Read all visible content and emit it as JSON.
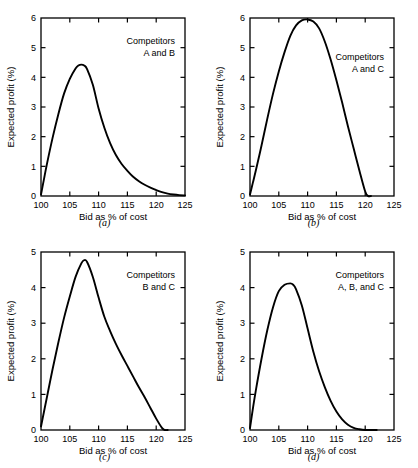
{
  "figure": {
    "background": "#ffffff",
    "line_color": "#000000",
    "axis_color": "#000000"
  },
  "panels": [
    {
      "key": "a",
      "caption": "(a)",
      "legend": {
        "line1": "Competitors",
        "line2": "A and B"
      },
      "chart_data": {
        "type": "line",
        "title": "Competitors A and B",
        "xlabel": "Bid as % of cost",
        "ylabel": "Expected profit (%)",
        "xlim": [
          100,
          125
        ],
        "ylim": [
          0,
          6
        ],
        "xticks": [
          100,
          105,
          110,
          115,
          120,
          125
        ],
        "yticks": [
          0,
          1,
          2,
          3,
          4,
          5,
          6
        ],
        "grid": false,
        "legend_position": "top-right",
        "series": [
          {
            "name": "A and B",
            "x": [
              100,
              100.5,
              101,
              102,
              103,
              104,
              105,
              106,
              106.5,
              107,
              107.5,
              108,
              109,
              110,
              111,
              112,
              113,
              114,
              115,
              116,
              117,
              118,
              119,
              120,
              121,
              122,
              123,
              124,
              125
            ],
            "values": [
              0.05,
              0.55,
              1.05,
              1.95,
              2.75,
              3.45,
              3.95,
              4.3,
              4.4,
              4.43,
              4.4,
              4.28,
              3.75,
              2.95,
              2.3,
              1.78,
              1.38,
              1.08,
              0.85,
              0.65,
              0.5,
              0.38,
              0.28,
              0.2,
              0.13,
              0.08,
              0.05,
              0.03,
              0.02
            ]
          }
        ]
      }
    },
    {
      "key": "b",
      "caption": "(b)",
      "legend": {
        "line1": "Competitors",
        "line2": "A and C"
      },
      "chart_data": {
        "type": "line",
        "title": "Competitors A and C",
        "xlabel": "Bid as % of cost",
        "ylabel": "Expected profit (%)",
        "xlim": [
          100,
          125
        ],
        "ylim": [
          0,
          6
        ],
        "xticks": [
          100,
          105,
          110,
          115,
          120,
          125
        ],
        "yticks": [
          0,
          1,
          2,
          3,
          4,
          5,
          6
        ],
        "grid": false,
        "legend_position": "right",
        "series": [
          {
            "name": "A and C",
            "x": [
              100,
              100.5,
              101,
              102,
              103,
              104,
              105,
              106,
              107,
              108,
              109,
              110,
              111,
              112,
              113,
              114,
              115,
              116,
              117,
              118,
              119,
              120,
              120.5,
              121
            ],
            "values": [
              0.05,
              0.45,
              0.85,
              1.7,
              2.6,
              3.45,
              4.2,
              4.85,
              5.4,
              5.75,
              5.92,
              5.95,
              5.88,
              5.65,
              5.2,
              4.6,
              3.9,
              3.15,
              2.35,
              1.6,
              0.85,
              0.15,
              0.0,
              0.0
            ]
          }
        ]
      }
    },
    {
      "key": "c",
      "caption": "(c)",
      "legend": {
        "line1": "Competitors",
        "line2": "B and C"
      },
      "chart_data": {
        "type": "line",
        "title": "Competitors B and C",
        "xlabel": "Bid as % of cost",
        "ylabel": "Expected profit (%)",
        "xlim": [
          100,
          125
        ],
        "ylim": [
          0,
          5
        ],
        "xticks": [
          100,
          105,
          110,
          115,
          120,
          125
        ],
        "yticks": [
          0,
          1,
          2,
          3,
          4,
          5
        ],
        "grid": false,
        "legend_position": "top-right",
        "series": [
          {
            "name": "B and C",
            "x": [
              100,
              100.5,
              101,
              102,
              103,
              104,
              105,
              106,
              107,
              107.5,
              108,
              109,
              110,
              111,
              112,
              113,
              114,
              115,
              116,
              117,
              118,
              119,
              120,
              121,
              121.5,
              122
            ],
            "values": [
              0.1,
              0.5,
              0.9,
              1.7,
              2.45,
              3.15,
              3.75,
              4.3,
              4.68,
              4.77,
              4.72,
              4.3,
              3.72,
              3.18,
              2.78,
              2.42,
              2.1,
              1.8,
              1.5,
              1.2,
              0.92,
              0.62,
              0.32,
              0.06,
              0.0,
              0.0
            ]
          }
        ]
      }
    },
    {
      "key": "d",
      "caption": "(d)",
      "legend": {
        "line1": "Competitors",
        "line2": "A, B, and C"
      },
      "chart_data": {
        "type": "line",
        "title": "Competitors A, B, and C",
        "xlabel": "Bid as % of cost",
        "ylabel": "Expected profit (%)",
        "xlim": [
          100,
          125
        ],
        "ylim": [
          0,
          5
        ],
        "xticks": [
          100,
          105,
          110,
          115,
          120,
          125
        ],
        "yticks": [
          0,
          1,
          2,
          3,
          4,
          5
        ],
        "grid": false,
        "legend_position": "top-right",
        "series": [
          {
            "name": "A, B, and C",
            "x": [
              100,
              100.5,
              101,
              102,
              103,
              104,
              105,
              106,
              107,
              107.5,
              108,
              109,
              110,
              111,
              112,
              113,
              114,
              115,
              116,
              117,
              118,
              119,
              120,
              121,
              122
            ],
            "values": [
              0.05,
              0.6,
              1.1,
              2.0,
              2.8,
              3.45,
              3.9,
              4.08,
              4.12,
              4.08,
              3.95,
              3.5,
              2.85,
              2.2,
              1.65,
              1.2,
              0.82,
              0.52,
              0.3,
              0.15,
              0.06,
              0.02,
              0.0,
              0.0,
              0.0
            ]
          }
        ]
      }
    }
  ]
}
